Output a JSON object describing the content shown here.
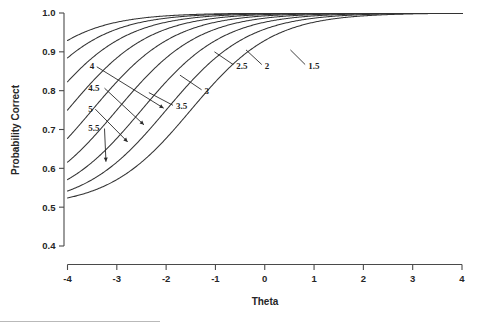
{
  "chart_data": {
    "type": "line",
    "title": "",
    "xlabel": "Theta",
    "ylabel": "Probability Correct",
    "xlim": [
      -4,
      4
    ],
    "ylim": [
      0.4,
      1.0
    ],
    "xticks": [
      "-4",
      "-3",
      "-2",
      "-1",
      "0",
      "1",
      "2",
      "3",
      "4"
    ],
    "xtick_values": [
      -4,
      -3,
      -2,
      -1,
      0,
      1,
      2,
      3,
      4
    ],
    "yticks": [
      "0.4",
      "0.5",
      "0.6",
      "0.7",
      "0.8",
      "0.9",
      "1.0"
    ],
    "ytick_values": [
      0.4,
      0.5,
      0.6,
      0.7,
      0.8,
      0.9,
      1.0
    ],
    "grid": false,
    "legend": "inline-annotations",
    "model": "P(theta) = 0.5 + 0.5 / (1 + exp(-1.2 * (theta + b)))",
    "lower_asymptote": 0.5,
    "upper_asymptote": 1.0,
    "series": [
      {
        "name": "1.5",
        "b": 1.5,
        "a": 1.2,
        "x": [
          -4,
          -3,
          -2,
          -1,
          0,
          1,
          2,
          3,
          4
        ],
        "values": [
          0.503,
          0.512,
          0.54,
          0.622,
          0.786,
          0.918,
          0.972,
          0.991,
          0.997
        ]
      },
      {
        "name": "2",
        "b": 2.0,
        "a": 1.2,
        "x": [
          -4,
          -3,
          -2,
          -1,
          0,
          1,
          2,
          3,
          4
        ],
        "values": [
          0.508,
          0.522,
          0.571,
          0.686,
          0.846,
          0.945,
          0.982,
          0.995,
          0.998
        ]
      },
      {
        "name": "2.5",
        "b": 2.5,
        "a": 1.2,
        "x": [
          -4,
          -3,
          -2,
          -1,
          0,
          1,
          2,
          3,
          4
        ],
        "values": [
          0.513,
          0.54,
          0.612,
          0.75,
          0.89,
          0.963,
          0.988,
          0.996,
          0.999
        ]
      },
      {
        "name": "3",
        "b": 3.0,
        "a": 1.2,
        "x": [
          -4,
          -3,
          -2,
          -1,
          0,
          1,
          2,
          3,
          4
        ],
        "values": [
          0.522,
          0.571,
          0.664,
          0.805,
          0.92,
          0.975,
          0.992,
          0.998,
          0.999
        ]
      },
      {
        "name": "3.5",
        "b": 3.5,
        "a": 1.2,
        "x": [
          -4,
          -3,
          -2,
          -1,
          0,
          1,
          2,
          3,
          4
        ],
        "values": [
          0.538,
          0.612,
          0.723,
          0.851,
          0.941,
          0.982,
          0.995,
          0.998,
          1.0
        ]
      },
      {
        "name": "4",
        "b": 4.0,
        "a": 1.2,
        "x": [
          -4,
          -3,
          -2,
          -1,
          0,
          1,
          2,
          3,
          4
        ],
        "values": [
          0.5,
          0.664,
          0.78,
          0.888,
          0.957,
          0.987,
          0.996,
          0.999,
          1.0
        ]
      },
      {
        "name": "4.5",
        "b": 4.5,
        "a": 1.2,
        "x": [
          -4,
          -3,
          -2,
          -1,
          0,
          1,
          2,
          3,
          4
        ],
        "values": [
          0.546,
          0.7,
          0.812,
          0.905,
          0.963,
          0.989,
          0.997,
          0.999,
          1.0
        ]
      },
      {
        "name": "5",
        "b": 5.0,
        "a": 1.2,
        "x": [
          -4,
          -3,
          -2,
          -1,
          0,
          1,
          2,
          3,
          4
        ],
        "values": [
          0.551,
          0.73,
          0.838,
          0.92,
          0.969,
          0.991,
          0.997,
          0.999,
          1.0
        ]
      },
      {
        "name": "5.5",
        "b": 5.5,
        "a": 1.2,
        "x": [
          -4,
          -3,
          -2,
          -1,
          0,
          1,
          2,
          3,
          4
        ],
        "values": [
          0.555,
          0.755,
          0.858,
          0.931,
          0.974,
          0.992,
          0.998,
          0.999,
          1.0
        ]
      }
    ],
    "annotations": [
      {
        "label": "4",
        "label_x": -3.55,
        "label_y": 0.855,
        "point_x": -2.05,
        "point_y": 0.755,
        "side": "left"
      },
      {
        "label": "4.5",
        "label_x": -3.58,
        "label_y": 0.8,
        "point_x": -2.45,
        "point_y": 0.712,
        "side": "left"
      },
      {
        "label": "5",
        "label_x": -3.58,
        "label_y": 0.746,
        "point_x": -2.78,
        "point_y": 0.668,
        "side": "left"
      },
      {
        "label": "5.5",
        "label_x": -3.58,
        "label_y": 0.696,
        "point_x": -3.22,
        "point_y": 0.617,
        "side": "left"
      },
      {
        "label": "3.5",
        "label_x": -1.8,
        "label_y": 0.752,
        "point_x": -2.35,
        "point_y": 0.795,
        "side": "right"
      },
      {
        "label": "3",
        "label_x": -1.22,
        "label_y": 0.792,
        "point_x": -1.72,
        "point_y": 0.84,
        "side": "right"
      },
      {
        "label": "2.5",
        "label_x": -0.58,
        "label_y": 0.857,
        "point_x": -1.02,
        "point_y": 0.9,
        "side": "right"
      },
      {
        "label": "2",
        "label_x": 0.0,
        "label_y": 0.857,
        "point_x": -0.38,
        "point_y": 0.905,
        "side": "right"
      },
      {
        "label": "1.5",
        "label_x": 0.88,
        "label_y": 0.857,
        "point_x": 0.52,
        "point_y": 0.905,
        "side": "right"
      }
    ]
  }
}
